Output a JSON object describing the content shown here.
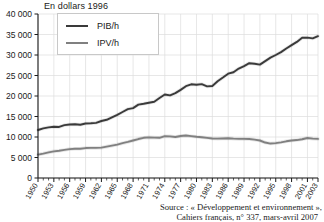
{
  "title": "En dollars 1996",
  "legend": {
    "position": "top-left-inside",
    "entries": [
      {
        "label": "PIB/h",
        "color": "#3a3a3a"
      },
      {
        "label": "IPV/h",
        "color": "#808080"
      }
    ]
  },
  "source": {
    "line1": "Source : « Développement et environnement »,",
    "line2": "Cahiers français, n° 337, mars-avril 2007"
  },
  "axes": {
    "y_ticks": [
      "0",
      "5 000",
      "10 000",
      "15 000",
      "20 000",
      "25 000",
      "30 000",
      "35 000",
      "40 000"
    ],
    "x_ticks": [
      "1950",
      "1953",
      "1956",
      "1959",
      "1962",
      "1965",
      "1968",
      "1971",
      "1974",
      "1977",
      "1980",
      "1983",
      "1986",
      "1989",
      "1992",
      "1995",
      "1998",
      "2001",
      "2003"
    ]
  },
  "chart_data": {
    "type": "line",
    "title": "En dollars 1996",
    "xlabel": "",
    "ylabel": "",
    "ylim": [
      0,
      40000
    ],
    "xlim": [
      1950,
      2003
    ],
    "grid": true,
    "legend_position": "upper left",
    "x": [
      1950,
      1951,
      1952,
      1953,
      1954,
      1955,
      1956,
      1957,
      1958,
      1959,
      1960,
      1961,
      1962,
      1963,
      1964,
      1965,
      1966,
      1967,
      1968,
      1969,
      1970,
      1971,
      1972,
      1973,
      1974,
      1975,
      1976,
      1977,
      1978,
      1979,
      1980,
      1981,
      1982,
      1983,
      1984,
      1985,
      1986,
      1987,
      1988,
      1989,
      1990,
      1991,
      1992,
      1993,
      1994,
      1995,
      1996,
      1997,
      1998,
      1999,
      2000,
      2001,
      2002,
      2003
    ],
    "series": [
      {
        "name": "PIB/h",
        "color": "#3a3a3a",
        "values": [
          11700,
          12100,
          12350,
          12500,
          12450,
          12900,
          13050,
          13100,
          13000,
          13300,
          13350,
          13450,
          13900,
          14200,
          14800,
          15400,
          16100,
          16800,
          17050,
          17900,
          18100,
          18350,
          18600,
          19500,
          20350,
          20150,
          20700,
          21500,
          22400,
          22850,
          22750,
          22900,
          22350,
          22450,
          23600,
          24500,
          25450,
          25800,
          26700,
          27300,
          28000,
          27850,
          27650,
          28500,
          29350,
          30000,
          30700,
          31600,
          32400,
          33200,
          34200,
          34250,
          34050,
          34600
        ]
      },
      {
        "name": "IPV/h",
        "color": "#808080",
        "values": [
          5700,
          5950,
          6250,
          6500,
          6650,
          6850,
          7050,
          7150,
          7150,
          7300,
          7350,
          7350,
          7400,
          7650,
          7900,
          8150,
          8500,
          8800,
          9150,
          9500,
          9800,
          9900,
          9850,
          9800,
          10200,
          10150,
          10000,
          10250,
          10350,
          10200,
          10050,
          9950,
          9800,
          9650,
          9600,
          9650,
          9700,
          9600,
          9550,
          9550,
          9500,
          9350,
          9150,
          8650,
          8400,
          8500,
          8700,
          8950,
          9150,
          9250,
          9450,
          9750,
          9600,
          9550
        ]
      }
    ]
  },
  "layout": {
    "plot_left": 38,
    "plot_right": 318,
    "plot_top": 14,
    "plot_bottom": 178
  }
}
